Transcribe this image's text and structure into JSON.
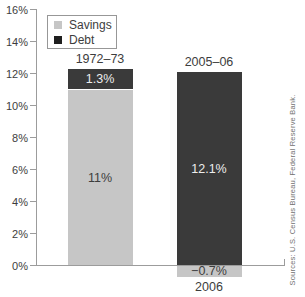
{
  "chart_data": {
    "type": "bar",
    "stacked": true,
    "title": "",
    "xlabel": "",
    "ylabel": "",
    "categories": [
      "1972–73",
      "2005–06"
    ],
    "x_sublabels": [
      "",
      "2006"
    ],
    "series": [
      {
        "name": "Savings",
        "color": "#c6c6c6",
        "legend_color": "#c6c6c6",
        "label_color": "#3d3d3d",
        "values": [
          11,
          -0.7
        ],
        "labels": [
          "11%",
          "−0.7%"
        ]
      },
      {
        "name": "Debt",
        "color": "#3a3a3a",
        "legend_color": "#1f1f1f",
        "label_color": "#ededed",
        "values": [
          1.3,
          12.1
        ],
        "labels": [
          "1.3%",
          "12.1%"
        ]
      }
    ],
    "ylim": [
      0,
      16
    ],
    "ytick_step": 2,
    "ytick_labels": [
      "0%",
      "2%",
      "4%",
      "6%",
      "8%",
      "10%",
      "12%",
      "14%",
      "16%"
    ],
    "legend_position": "top-left",
    "grid": false
  },
  "source_note": "Sources: U.S. Census Bureau, Federal Reserve Bank.",
  "colors": {
    "axis": "#9c9c9c",
    "text": "#3d3d3d",
    "source_text": "#707070",
    "background": "#ffffff"
  }
}
